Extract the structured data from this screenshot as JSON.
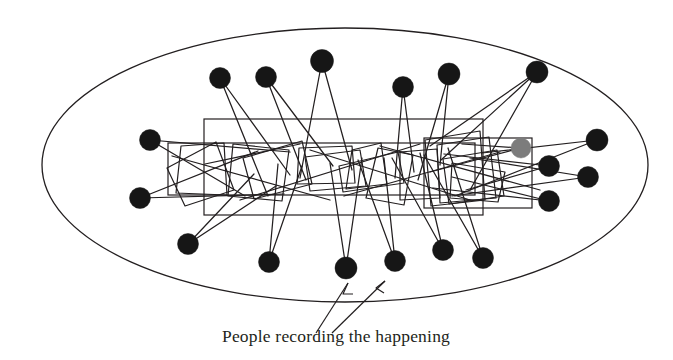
{
  "figure": {
    "type": "network-diagram",
    "title_visible": false,
    "background_color": "#ffffff",
    "stroke_color": "#231f20",
    "caption": {
      "text": "People recording the happening",
      "x": 336,
      "y": 342,
      "anchor": "middle",
      "font_size": 17.5,
      "color": "#231f20"
    }
  },
  "boundary": {
    "name": "crowd-boundary-ellipse",
    "shape": "ellipse",
    "cx": 345,
    "cy": 165,
    "rx": 303,
    "ry": 137,
    "stroke": "#231f20",
    "stroke_width": 1.3,
    "fill": "none"
  },
  "stage_rects": [
    {
      "name": "main-stage-rect",
      "x": 204,
      "y": 119,
      "width": 279,
      "height": 96,
      "stroke": "#231f20",
      "stroke_width": 1.2
    },
    {
      "name": "secondary-stage-rect",
      "x": 168,
      "y": 143,
      "width": 307,
      "height": 52,
      "stroke": "#231f20",
      "stroke_width": 1.2
    },
    {
      "name": "right-stage-rect",
      "x": 424,
      "y": 138,
      "width": 108,
      "height": 70,
      "stroke": "#231f20",
      "stroke_width": 1.2
    }
  ],
  "recording_quads": [
    {
      "name": "recording-device-quad-1",
      "points": "181,146 224,143 227,195 176,193"
    },
    {
      "name": "recording-device-quad-2",
      "points": "167,168 216,142 234,190 185,206"
    },
    {
      "name": "recording-device-quad-3",
      "points": "233,144 289,150 282,201 228,196"
    },
    {
      "name": "recording-device-quad-4",
      "points": "243,158 302,141 312,184 254,199"
    },
    {
      "name": "recording-device-quad-5",
      "points": "299,148 352,146 355,183 297,184"
    },
    {
      "name": "recording-device-quad-6",
      "points": "305,157 360,150 366,186 310,191"
    },
    {
      "name": "recording-device-quad-7",
      "points": "352,150 381,143 387,184 346,189"
    },
    {
      "name": "recording-device-quad-8",
      "points": "339,166 398,152 404,183 343,192"
    },
    {
      "name": "recording-device-quad-9",
      "points": "378,148 413,155 404,205 366,198"
    },
    {
      "name": "recording-device-quad-10",
      "points": "400,152 437,149 440,198 400,200"
    },
    {
      "name": "recording-device-quad-11",
      "points": "425,140 480,131 485,200 431,206"
    },
    {
      "name": "recording-device-quad-12",
      "points": "437,145 489,137 496,198 440,203"
    },
    {
      "name": "recording-device-quad-13",
      "points": "443,159 497,150 504,196 449,204"
    },
    {
      "name": "recording-device-quad-14",
      "points": "452,163 505,172 498,202 450,198"
    }
  ],
  "audience_nodes": [
    {
      "id": "n1",
      "name": "audience-node-top-1",
      "cx": 220,
      "cy": 78,
      "r": 10.5,
      "fill": "#161616"
    },
    {
      "id": "n2",
      "name": "audience-node-top-2",
      "cx": 266,
      "cy": 77,
      "r": 10.5,
      "fill": "#161616"
    },
    {
      "id": "n3",
      "name": "audience-node-top-3",
      "cx": 322,
      "cy": 61,
      "r": 11.5,
      "fill": "#161616"
    },
    {
      "id": "n4",
      "name": "audience-node-top-4",
      "cx": 403,
      "cy": 87,
      "r": 10.5,
      "fill": "#161616"
    },
    {
      "id": "n5",
      "name": "audience-node-top-5",
      "cx": 449,
      "cy": 74,
      "r": 11.0,
      "fill": "#161616"
    },
    {
      "id": "n6",
      "name": "audience-node-top-6",
      "cx": 537,
      "cy": 72,
      "r": 11.0,
      "fill": "#161616"
    },
    {
      "id": "n7",
      "name": "audience-node-left-1",
      "cx": 150,
      "cy": 140,
      "r": 10.5,
      "fill": "#161616"
    },
    {
      "id": "n8",
      "name": "audience-node-left-2",
      "cx": 140,
      "cy": 198,
      "r": 10.5,
      "fill": "#161616"
    },
    {
      "id": "n9",
      "name": "audience-node-right-1",
      "cx": 597,
      "cy": 140,
      "r": 11.0,
      "fill": "#161616"
    },
    {
      "id": "n10",
      "name": "audience-node-right-2",
      "cx": 549,
      "cy": 166,
      "r": 10.5,
      "fill": "#161616"
    },
    {
      "id": "n11",
      "name": "audience-node-right-3",
      "cx": 588,
      "cy": 177,
      "r": 10.5,
      "fill": "#161616"
    },
    {
      "id": "n12",
      "name": "audience-node-right-4",
      "cx": 549,
      "cy": 201,
      "r": 10.5,
      "fill": "#161616"
    },
    {
      "id": "n13",
      "name": "audience-node-bottom-1",
      "cx": 188,
      "cy": 244,
      "r": 10.5,
      "fill": "#161616"
    },
    {
      "id": "n14",
      "name": "audience-node-bottom-2",
      "cx": 269,
      "cy": 262,
      "r": 10.5,
      "fill": "#161616"
    },
    {
      "id": "n15",
      "name": "audience-node-bottom-3",
      "cx": 346,
      "cy": 268,
      "r": 11.0,
      "fill": "#161616"
    },
    {
      "id": "n16",
      "name": "audience-node-bottom-4",
      "cx": 395,
      "cy": 261,
      "r": 10.5,
      "fill": "#161616"
    },
    {
      "id": "n17",
      "name": "audience-node-bottom-5",
      "cx": 443,
      "cy": 250,
      "r": 10.5,
      "fill": "#161616"
    },
    {
      "id": "n18",
      "name": "audience-node-bottom-6",
      "cx": 483,
      "cy": 258,
      "r": 10.5,
      "fill": "#161616"
    },
    {
      "id": "n19",
      "name": "highlighted-node-gray",
      "cx": 521,
      "cy": 148,
      "r": 10.0,
      "fill": "#7c7c7c"
    }
  ],
  "sight_lines": [
    {
      "name": "sight-line-1",
      "x1": 220,
      "y1": 78,
      "x2": 268,
      "y2": 196
    },
    {
      "name": "sight-line-2",
      "x1": 220,
      "y1": 78,
      "x2": 290,
      "y2": 175
    },
    {
      "name": "sight-line-3",
      "x1": 266,
      "y1": 77,
      "x2": 306,
      "y2": 180
    },
    {
      "name": "sight-line-4",
      "x1": 266,
      "y1": 77,
      "x2": 333,
      "y2": 166
    },
    {
      "name": "sight-line-5",
      "x1": 322,
      "y1": 61,
      "x2": 300,
      "y2": 178
    },
    {
      "name": "sight-line-6",
      "x1": 322,
      "y1": 61,
      "x2": 352,
      "y2": 170
    },
    {
      "name": "sight-line-7",
      "x1": 403,
      "y1": 87,
      "x2": 395,
      "y2": 178
    },
    {
      "name": "sight-line-8",
      "x1": 403,
      "y1": 87,
      "x2": 414,
      "y2": 172
    },
    {
      "name": "sight-line-9",
      "x1": 449,
      "y1": 74,
      "x2": 418,
      "y2": 180
    },
    {
      "name": "sight-line-10",
      "x1": 449,
      "y1": 74,
      "x2": 440,
      "y2": 165
    },
    {
      "name": "sight-line-11",
      "x1": 537,
      "y1": 72,
      "x2": 441,
      "y2": 160
    },
    {
      "name": "sight-line-12",
      "x1": 537,
      "y1": 72,
      "x2": 470,
      "y2": 190
    },
    {
      "name": "sight-line-13",
      "x1": 537,
      "y1": 72,
      "x2": 430,
      "y2": 146
    },
    {
      "name": "sight-line-14",
      "x1": 150,
      "y1": 140,
      "x2": 290,
      "y2": 152
    },
    {
      "name": "sight-line-15",
      "x1": 150,
      "y1": 140,
      "x2": 245,
      "y2": 196
    },
    {
      "name": "sight-line-16",
      "x1": 140,
      "y1": 198,
      "x2": 258,
      "y2": 151
    },
    {
      "name": "sight-line-17",
      "x1": 140,
      "y1": 198,
      "x2": 284,
      "y2": 194
    },
    {
      "name": "sight-line-18",
      "x1": 597,
      "y1": 140,
      "x2": 482,
      "y2": 153
    },
    {
      "name": "sight-line-19",
      "x1": 597,
      "y1": 140,
      "x2": 455,
      "y2": 196
    },
    {
      "name": "sight-line-20",
      "x1": 549,
      "y1": 166,
      "x2": 444,
      "y2": 154
    },
    {
      "name": "sight-line-21",
      "x1": 549,
      "y1": 166,
      "x2": 466,
      "y2": 190
    },
    {
      "name": "sight-line-22",
      "x1": 588,
      "y1": 177,
      "x2": 470,
      "y2": 158
    },
    {
      "name": "sight-line-23",
      "x1": 588,
      "y1": 177,
      "x2": 452,
      "y2": 196
    },
    {
      "name": "sight-line-24",
      "x1": 549,
      "y1": 201,
      "x2": 452,
      "y2": 177
    },
    {
      "name": "sight-line-25",
      "x1": 549,
      "y1": 201,
      "x2": 433,
      "y2": 188
    },
    {
      "name": "sight-line-26",
      "x1": 188,
      "y1": 244,
      "x2": 254,
      "y2": 174
    },
    {
      "name": "sight-line-27",
      "x1": 188,
      "y1": 244,
      "x2": 276,
      "y2": 186
    },
    {
      "name": "sight-line-28",
      "x1": 269,
      "y1": 262,
      "x2": 278,
      "y2": 164
    },
    {
      "name": "sight-line-29",
      "x1": 269,
      "y1": 262,
      "x2": 302,
      "y2": 166
    },
    {
      "name": "sight-line-30",
      "x1": 346,
      "y1": 268,
      "x2": 330,
      "y2": 163
    },
    {
      "name": "sight-line-31",
      "x1": 346,
      "y1": 268,
      "x2": 362,
      "y2": 158
    },
    {
      "name": "sight-line-32",
      "x1": 395,
      "y1": 261,
      "x2": 358,
      "y2": 160
    },
    {
      "name": "sight-line-33",
      "x1": 395,
      "y1": 261,
      "x2": 384,
      "y2": 158
    },
    {
      "name": "sight-line-34",
      "x1": 443,
      "y1": 250,
      "x2": 392,
      "y2": 158
    },
    {
      "name": "sight-line-35",
      "x1": 443,
      "y1": 250,
      "x2": 420,
      "y2": 153
    },
    {
      "name": "sight-line-36",
      "x1": 483,
      "y1": 258,
      "x2": 424,
      "y2": 155
    },
    {
      "name": "sight-line-37",
      "x1": 483,
      "y1": 258,
      "x2": 448,
      "y2": 148
    },
    {
      "name": "sight-line-38",
      "x1": 521,
      "y1": 148,
      "x2": 430,
      "y2": 172
    },
    {
      "name": "sight-line-39",
      "x1": 521,
      "y1": 148,
      "x2": 462,
      "y2": 144
    },
    {
      "name": "sight-line-40",
      "x1": 205,
      "y1": 164,
      "x2": 300,
      "y2": 144
    },
    {
      "name": "sight-line-41",
      "x1": 172,
      "y1": 156,
      "x2": 330,
      "y2": 200
    },
    {
      "name": "sight-line-42",
      "x1": 310,
      "y1": 150,
      "x2": 470,
      "y2": 200
    },
    {
      "name": "sight-line-43",
      "x1": 344,
      "y1": 196,
      "x2": 500,
      "y2": 152
    },
    {
      "name": "sight-line-44",
      "x1": 380,
      "y1": 146,
      "x2": 540,
      "y2": 190
    },
    {
      "name": "sight-line-45",
      "x1": 240,
      "y1": 200,
      "x2": 420,
      "y2": 144
    }
  ],
  "annotation_arrows": [
    {
      "name": "annotation-arrow-left",
      "path": "M 316,333 L 348,283",
      "head_points": "348,283 343,294 353,294"
    },
    {
      "name": "annotation-arrow-right",
      "path": "M 332,333 L 385,281",
      "head_points": "385,281 376,288 384,293"
    }
  ]
}
